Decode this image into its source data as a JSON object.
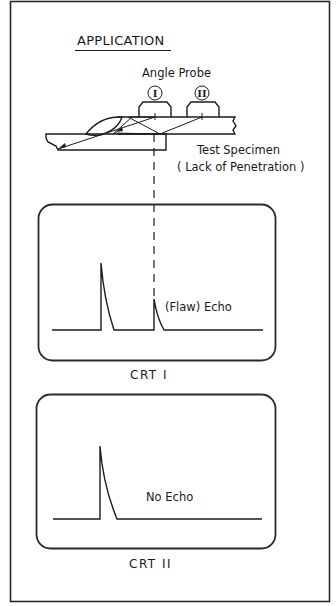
{
  "diagram": {
    "title": "APPLICATION",
    "probe_label": "Angle Probe",
    "probes": [
      {
        "id": "I",
        "label": "I"
      },
      {
        "id": "II",
        "label": "II"
      }
    ],
    "specimen_label": "Test Specimen",
    "specimen_sublabel": "( Lack of Penetration )",
    "crt_screens": [
      {
        "name": "CRT I",
        "echo_label": "(Flaw) Echo",
        "signals": [
          "initial pulse",
          "flaw echo"
        ]
      },
      {
        "name": "CRT II",
        "echo_label": "No Echo",
        "signals": [
          "initial pulse"
        ]
      }
    ],
    "colors": {
      "line": "#1c1c1c",
      "background": "#ffffff"
    }
  }
}
